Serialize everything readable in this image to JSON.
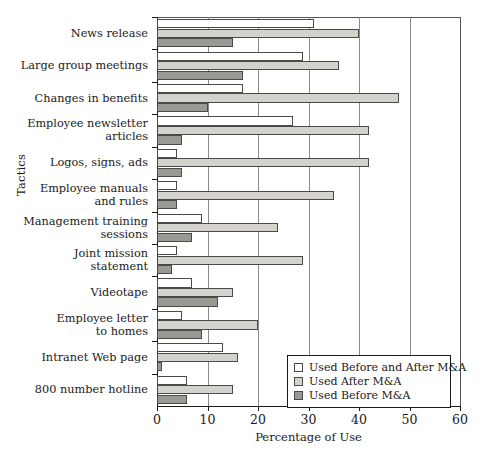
{
  "chart_data": {
    "type": "bar",
    "orientation": "horizontal",
    "title": "",
    "xlabel": "Percentage of Use",
    "ylabel": "Tactics",
    "xlim": [
      0,
      60
    ],
    "xticks": [
      0,
      10,
      20,
      30,
      40,
      50,
      60
    ],
    "grid": true,
    "legend_position": "lower right",
    "categories": [
      "News release",
      "Large group meetings",
      "Changes in benefits",
      "Employee newsletter\narticles",
      "Logos, signs, ads",
      "Employee manuals\nand rules",
      "Management training\nsessions",
      "Joint mission\nstatement",
      "Videotape",
      "Employee letter\nto homes",
      "Intranet Web page",
      "800 number hotline"
    ],
    "series": [
      {
        "name": "Used Before and After M&A",
        "color": "#ffffff",
        "values": [
          31,
          29,
          17,
          27,
          4,
          4,
          9,
          4,
          7,
          5,
          13,
          6
        ]
      },
      {
        "name": "Used After M&A",
        "color": "#d4d2cd",
        "values": [
          40,
          36,
          48,
          42,
          42,
          35,
          24,
          29,
          15,
          20,
          16,
          15
        ]
      },
      {
        "name": "Used Before M&A",
        "color": "#9b9994",
        "values": [
          15,
          17,
          10,
          5,
          5,
          4,
          7,
          3,
          12,
          9,
          1,
          6
        ]
      }
    ]
  },
  "axis": {
    "y_title": "Tactics",
    "x_title": "Percentage of Use",
    "x_tick_labels": [
      "0",
      "10",
      "20",
      "30",
      "40",
      "50",
      "60"
    ]
  },
  "legend": {
    "entries": [
      "Used Before and After M&A",
      "Used After M&A",
      "Used Before M&A"
    ]
  }
}
